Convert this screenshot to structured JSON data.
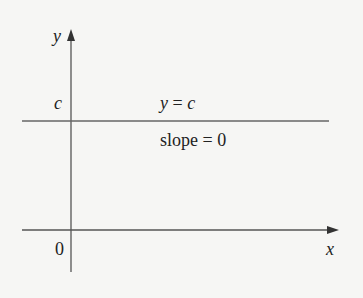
{
  "diagram": {
    "axes": {
      "x_label": "x",
      "y_label": "y",
      "origin_label": "0"
    },
    "line": {
      "level_label": "c",
      "equation_lhs": "y",
      "equation_eq": " = ",
      "equation_rhs": "c",
      "slope_text": "slope = 0"
    },
    "colors": {
      "background": "#f6f6f4",
      "stroke": "#555555",
      "text": "#222222"
    }
  }
}
